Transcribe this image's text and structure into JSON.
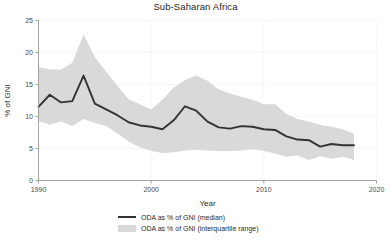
{
  "chart_data": {
    "type": "line",
    "title": "Sub-Saharan Africa",
    "xlabel": "Year",
    "ylabel": "% of GNI",
    "xlim": [
      1990,
      2020
    ],
    "ylim": [
      0,
      25
    ],
    "xticks": [
      1990,
      2000,
      2010,
      2020
    ],
    "yticks": [
      0,
      5,
      10,
      15,
      20,
      25
    ],
    "grid": true,
    "legend_position": "below",
    "x": [
      1990,
      1991,
      1992,
      1993,
      1994,
      1995,
      1996,
      1997,
      1998,
      1999,
      2000,
      2001,
      2002,
      2003,
      2004,
      2005,
      2006,
      2007,
      2008,
      2009,
      2010,
      2011,
      2012,
      2013,
      2014,
      2015,
      2016,
      2017,
      2018
    ],
    "series": [
      {
        "name": "ODA as % of GNI (median)",
        "type": "line",
        "color": "#333333",
        "values": [
          11.5,
          13.4,
          12.2,
          12.4,
          16.4,
          12.0,
          11.1,
          10.2,
          9.1,
          8.6,
          8.4,
          8.0,
          9.4,
          11.6,
          10.9,
          9.2,
          8.3,
          8.1,
          8.5,
          8.4,
          8.0,
          7.9,
          6.9,
          6.4,
          6.3,
          5.3,
          5.7,
          5.5,
          5.5
        ]
      },
      {
        "name": "ODA as % of GNI (interquartile range)",
        "type": "band",
        "color": "#d9d9d9",
        "upper": [
          17.7,
          17.4,
          17.3,
          18.4,
          22.8,
          19.3,
          17.0,
          14.8,
          12.7,
          11.9,
          11.1,
          12.6,
          14.5,
          15.7,
          16.4,
          15.6,
          14.2,
          13.6,
          13.1,
          12.6,
          11.9,
          11.9,
          10.4,
          9.6,
          9.2,
          8.7,
          8.4,
          8.0,
          7.3
        ],
        "lower": [
          9.3,
          8.7,
          9.2,
          8.5,
          9.6,
          9.0,
          8.5,
          7.4,
          6.1,
          5.2,
          4.6,
          4.3,
          4.4,
          4.7,
          4.8,
          4.7,
          4.6,
          4.6,
          4.7,
          4.9,
          4.6,
          4.2,
          3.7,
          3.9,
          3.2,
          3.8,
          3.4,
          3.7,
          3.2
        ]
      }
    ]
  },
  "legend": {
    "items": [
      {
        "label": "ODA as % of GNI (median)",
        "key": "line-key"
      },
      {
        "label": "ODA as % of GNI (interquartile range)",
        "key": "band-key"
      }
    ]
  },
  "colors": {
    "median_line": "#333333",
    "band_fill": "#d9d9d9",
    "grid": "#e8e8e8",
    "axis": "#9a9a9a",
    "background": "#ffffff"
  }
}
